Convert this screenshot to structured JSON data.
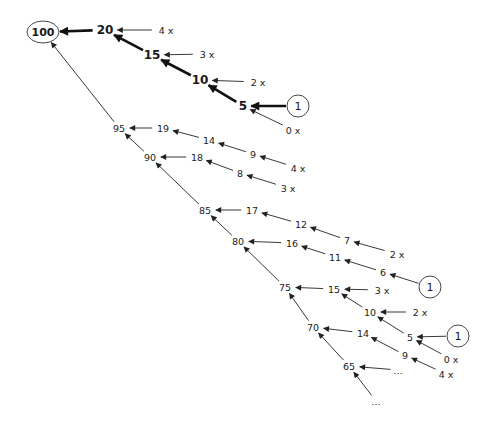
{
  "diagram": {
    "type": "tree",
    "colors": {
      "line": "#222222",
      "text": "#1a1a1a",
      "background": "#ffffff"
    },
    "nodes": [
      {
        "id": "n100",
        "label": "100",
        "x": 43,
        "y": 32,
        "shape": "ellipse",
        "bold": true
      },
      {
        "id": "n20",
        "label": "20",
        "x": 105,
        "y": 30,
        "bold": true
      },
      {
        "id": "n20x",
        "label": "4 x",
        "x": 166,
        "y": 30
      },
      {
        "id": "n15",
        "label": "15",
        "x": 152,
        "y": 55,
        "bold": true
      },
      {
        "id": "n15x",
        "label": "3 x",
        "x": 207,
        "y": 54
      },
      {
        "id": "n10",
        "label": "10",
        "x": 200,
        "y": 80,
        "bold": true
      },
      {
        "id": "n10x",
        "label": "2 x",
        "x": 258,
        "y": 82
      },
      {
        "id": "n5",
        "label": "5",
        "x": 243,
        "y": 106,
        "bold": true
      },
      {
        "id": "c1a",
        "label": "1",
        "x": 298,
        "y": 106,
        "shape": "circle"
      },
      {
        "id": "n5x",
        "label": "0 x",
        "x": 293,
        "y": 130
      },
      {
        "id": "n95",
        "label": "95",
        "x": 119,
        "y": 128
      },
      {
        "id": "n19",
        "label": "19",
        "x": 163,
        "y": 128
      },
      {
        "id": "n14a",
        "label": "14",
        "x": 209,
        "y": 140
      },
      {
        "id": "n9a",
        "label": "9",
        "x": 253,
        "y": 154
      },
      {
        "id": "n9ax",
        "label": "4 x",
        "x": 298,
        "y": 168
      },
      {
        "id": "n90",
        "label": "90",
        "x": 150,
        "y": 157
      },
      {
        "id": "n18",
        "label": "18",
        "x": 197,
        "y": 157
      },
      {
        "id": "n8",
        "label": "8",
        "x": 240,
        "y": 173
      },
      {
        "id": "n8x",
        "label": "3 x",
        "x": 288,
        "y": 188
      },
      {
        "id": "n85",
        "label": "85",
        "x": 205,
        "y": 210
      },
      {
        "id": "n17",
        "label": "17",
        "x": 252,
        "y": 210
      },
      {
        "id": "n12",
        "label": "12",
        "x": 301,
        "y": 224
      },
      {
        "id": "n7",
        "label": "7",
        "x": 347,
        "y": 240
      },
      {
        "id": "n7x",
        "label": "2 x",
        "x": 397,
        "y": 254
      },
      {
        "id": "n80",
        "label": "80",
        "x": 238,
        "y": 241
      },
      {
        "id": "n16",
        "label": "16",
        "x": 292,
        "y": 243
      },
      {
        "id": "n11",
        "label": "11",
        "x": 335,
        "y": 257
      },
      {
        "id": "n6",
        "label": "6",
        "x": 383,
        "y": 272
      },
      {
        "id": "c1b",
        "label": "1",
        "x": 430,
        "y": 287,
        "shape": "circle"
      },
      {
        "id": "n75",
        "label": "75",
        "x": 285,
        "y": 287
      },
      {
        "id": "n15b",
        "label": "15",
        "x": 334,
        "y": 289
      },
      {
        "id": "n15bx",
        "label": "3 x",
        "x": 382,
        "y": 290
      },
      {
        "id": "n10b",
        "label": "10",
        "x": 370,
        "y": 312
      },
      {
        "id": "n10bx",
        "label": "2 x",
        "x": 420,
        "y": 312
      },
      {
        "id": "n70",
        "label": "70",
        "x": 313,
        "y": 327
      },
      {
        "id": "n14b",
        "label": "14",
        "x": 363,
        "y": 333
      },
      {
        "id": "n5b",
        "label": "5",
        "x": 410,
        "y": 337
      },
      {
        "id": "c1c",
        "label": "1",
        "x": 458,
        "y": 336,
        "shape": "circle"
      },
      {
        "id": "n9b",
        "label": "9",
        "x": 405,
        "y": 355
      },
      {
        "id": "n5bx",
        "label": "0 x",
        "x": 451,
        "y": 359
      },
      {
        "id": "n9bx",
        "label": "4 x",
        "x": 446,
        "y": 374
      },
      {
        "id": "n65",
        "label": "65",
        "x": 349,
        "y": 366
      },
      {
        "id": "dots1",
        "label": "…",
        "x": 398,
        "y": 370
      },
      {
        "id": "dots2",
        "label": "…",
        "x": 376,
        "y": 401
      }
    ],
    "edges": [
      {
        "from": "n20",
        "to": "n100",
        "weight": "thick"
      },
      {
        "from": "n15",
        "to": "n20",
        "weight": "thick"
      },
      {
        "from": "n10",
        "to": "n15",
        "weight": "thick"
      },
      {
        "from": "n5",
        "to": "n10",
        "weight": "thick"
      },
      {
        "from": "c1a",
        "to": "n5",
        "weight": "thick"
      },
      {
        "from": "n20x",
        "to": "n20"
      },
      {
        "from": "n15x",
        "to": "n15"
      },
      {
        "from": "n10x",
        "to": "n10"
      },
      {
        "from": "n5x",
        "to": "n5"
      },
      {
        "from": "n95",
        "to": "n100"
      },
      {
        "from": "n19",
        "to": "n95"
      },
      {
        "from": "n14a",
        "to": "n19"
      },
      {
        "from": "n9a",
        "to": "n14a"
      },
      {
        "from": "n9ax",
        "to": "n9a"
      },
      {
        "from": "n90",
        "to": "n95"
      },
      {
        "from": "n18",
        "to": "n90"
      },
      {
        "from": "n8",
        "to": "n18"
      },
      {
        "from": "n8x",
        "to": "n8"
      },
      {
        "from": "n85",
        "to": "n90"
      },
      {
        "from": "n17",
        "to": "n85"
      },
      {
        "from": "n12",
        "to": "n17"
      },
      {
        "from": "n7",
        "to": "n12"
      },
      {
        "from": "n7x",
        "to": "n7"
      },
      {
        "from": "n80",
        "to": "n85"
      },
      {
        "from": "n16",
        "to": "n80"
      },
      {
        "from": "n11",
        "to": "n16"
      },
      {
        "from": "n6",
        "to": "n11"
      },
      {
        "from": "c1b",
        "to": "n6"
      },
      {
        "from": "n75",
        "to": "n80"
      },
      {
        "from": "n15b",
        "to": "n75"
      },
      {
        "from": "n15bx",
        "to": "n15b"
      },
      {
        "from": "n10b",
        "to": "n15b"
      },
      {
        "from": "n10bx",
        "to": "n10b"
      },
      {
        "from": "n70",
        "to": "n75"
      },
      {
        "from": "n14b",
        "to": "n70"
      },
      {
        "from": "n5b",
        "to": "n10b"
      },
      {
        "from": "c1c",
        "to": "n5b"
      },
      {
        "from": "n5bx",
        "to": "n5b"
      },
      {
        "from": "n9b",
        "to": "n14b"
      },
      {
        "from": "n9bx",
        "to": "n9b"
      },
      {
        "from": "n65",
        "to": "n70"
      },
      {
        "from": "dots1",
        "to": "n65"
      },
      {
        "from": "dots2",
        "to": "n65"
      }
    ]
  }
}
